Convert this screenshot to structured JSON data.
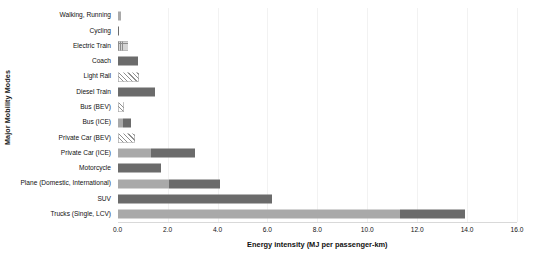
{
  "chart_data": {
    "type": "bar",
    "orientation": "horizontal",
    "stacked": true,
    "title": "",
    "xlabel": "Energy intensity (MJ per passenger-km)",
    "ylabel": "Major Mobility Modes",
    "xlim": [
      0.0,
      16.0
    ],
    "xticks": [
      "0.0",
      "2.0",
      "4.0",
      "6.0",
      "8.0",
      "10.0",
      "12.0",
      "14.0",
      "16.0"
    ],
    "xtick_values": [
      0.0,
      2.0,
      4.0,
      6.0,
      8.0,
      10.0,
      12.0,
      14.0,
      16.0
    ],
    "grid": "vertical-light",
    "legend": "none",
    "categories": [
      "Walking, Running",
      "Cycling",
      "Electric Train",
      "Coach",
      "Light Rail",
      "Diesel Train",
      "Bus (BEV)",
      "Bus (ICE)",
      "Private Car (BEV)",
      "Private Car (ICE)",
      "Motorcycle",
      "Plane (Domestic, International)",
      "SUV",
      "Trucks (Single, LCV)"
    ],
    "bars": [
      {
        "category": "Walking, Running",
        "total": 0.15,
        "segments": [
          {
            "value": 0.15,
            "style": "light"
          }
        ]
      },
      {
        "category": "Cycling",
        "total": 0.06,
        "segments": [
          {
            "value": 0.06,
            "style": "dark"
          }
        ]
      },
      {
        "category": "Electric Train",
        "total": 0.4,
        "segments": [
          {
            "value": 0.4,
            "style": "hatch-dot"
          }
        ]
      },
      {
        "category": "Coach",
        "total": 0.8,
        "segments": [
          {
            "value": 0.8,
            "style": "dark"
          }
        ]
      },
      {
        "category": "Light Rail",
        "total": 0.85,
        "segments": [
          {
            "value": 0.85,
            "style": "hatch-diag"
          }
        ]
      },
      {
        "category": "Diesel Train",
        "total": 1.5,
        "segments": [
          {
            "value": 1.5,
            "style": "dark"
          }
        ]
      },
      {
        "category": "Bus (BEV)",
        "total": 0.25,
        "segments": [
          {
            "value": 0.25,
            "style": "hatch-diag"
          }
        ]
      },
      {
        "category": "Bus (ICE)",
        "total": 0.52,
        "segments": [
          {
            "value": 0.22,
            "style": "light"
          },
          {
            "value": 0.3,
            "style": "dark"
          }
        ]
      },
      {
        "category": "Private Car (BEV)",
        "total": 0.68,
        "segments": [
          {
            "value": 0.68,
            "style": "hatch-diag"
          }
        ]
      },
      {
        "category": "Private Car (ICE)",
        "total": 3.1,
        "segments": [
          {
            "value": 1.33,
            "style": "light"
          },
          {
            "value": 1.77,
            "style": "dark"
          }
        ]
      },
      {
        "category": "Motorcycle",
        "total": 1.73,
        "segments": [
          {
            "value": 1.73,
            "style": "dark"
          }
        ]
      },
      {
        "category": "Plane (Domestic, International)",
        "total": 4.1,
        "segments": [
          {
            "value": 2.05,
            "style": "light"
          },
          {
            "value": 2.05,
            "style": "dark"
          }
        ]
      },
      {
        "category": "SUV",
        "total": 6.2,
        "segments": [
          {
            "value": 6.2,
            "style": "dark"
          }
        ]
      },
      {
        "category": "Trucks (Single, LCV)",
        "total": 13.9,
        "segments": [
          {
            "value": 11.3,
            "style": "light"
          },
          {
            "value": 2.6,
            "style": "dark"
          }
        ]
      }
    ],
    "colors": {
      "light": "#a9a9a9",
      "dark": "#6b6b6b",
      "hatch": "#8f8f8f",
      "grid": "#f2f2f2",
      "axis": "#d9d9d9",
      "text": "#111111"
    }
  }
}
